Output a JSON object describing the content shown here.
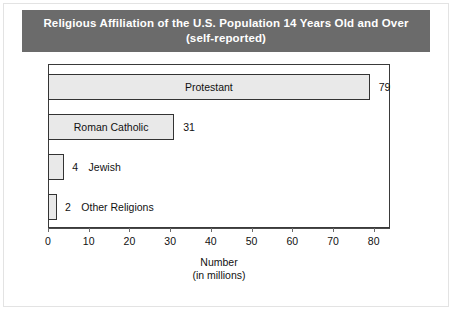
{
  "title": {
    "line1": "Religious Affiliation of the U.S. Population 14 Years Old and Over",
    "line2": "(self-reported)",
    "background_color": "#6b6b6b",
    "text_color": "#ffffff"
  },
  "chart_data": {
    "type": "bar",
    "orientation": "horizontal",
    "title": "Religious Affiliation of the U.S. Population 14 Years Old and Over (self-reported)",
    "categories": [
      "Protestant",
      "Roman Catholic",
      "Jewish",
      "Other Religions"
    ],
    "values": [
      79,
      31,
      4,
      2
    ],
    "labels": [
      "Protestant",
      "Roman Catholic",
      "Jewish",
      "Other Religions"
    ],
    "value_labels": [
      "79",
      "31",
      "4",
      "2"
    ],
    "label_placement": [
      "inside",
      "inside",
      "outside",
      "outside"
    ],
    "xlabel": "Number",
    "xlabel_sub": "(in millions)",
    "ylabel": "",
    "xlim": [
      0,
      84
    ],
    "xticks": [
      0,
      10,
      20,
      30,
      40,
      50,
      60,
      70,
      80
    ],
    "xtick_labels": [
      "0",
      "10",
      "20",
      "30",
      "40",
      "50",
      "60",
      "70",
      "80"
    ],
    "grid": false,
    "legend": false,
    "bar_fill_color": "#e9e9e9",
    "bar_border_color": "#333333"
  },
  "axis": {
    "title_line1": "Number",
    "title_line2": "(in millions)"
  }
}
